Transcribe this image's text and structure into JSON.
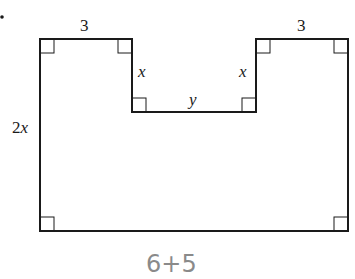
{
  "diagram": {
    "type": "geometry-figure",
    "shape": "rectangle-with-rectangular-notch",
    "labels": {
      "top_left_width": "3",
      "top_right_width": "3",
      "left_notch_height": "x",
      "right_notch_height": "x",
      "notch_width": "y",
      "left_height": "2x"
    },
    "handwritten_note": "6+5",
    "right_angle_markers": 8,
    "colors": {
      "line": "#1a1a1a",
      "handwriting": "#8a8a8a",
      "background": "#ffffff"
    }
  }
}
